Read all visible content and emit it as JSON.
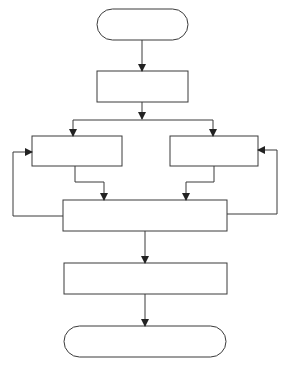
{
  "diagram": {
    "type": "flowchart",
    "colors": {
      "stroke": "#3a3a3a",
      "fill": "#ffffff",
      "background": "#ffffff"
    },
    "nodes": [
      {
        "id": "start",
        "shape": "terminator",
        "label": ""
      },
      {
        "id": "step1",
        "shape": "process",
        "label": ""
      },
      {
        "id": "branch-left",
        "shape": "process",
        "label": ""
      },
      {
        "id": "branch-right",
        "shape": "process",
        "label": ""
      },
      {
        "id": "merge",
        "shape": "process",
        "label": ""
      },
      {
        "id": "step4",
        "shape": "process",
        "label": ""
      },
      {
        "id": "end",
        "shape": "terminator",
        "label": ""
      }
    ],
    "edges": [
      {
        "from": "start",
        "to": "step1"
      },
      {
        "from": "step1",
        "to": "branch-left"
      },
      {
        "from": "step1",
        "to": "branch-right"
      },
      {
        "from": "branch-left",
        "to": "merge"
      },
      {
        "from": "branch-right",
        "to": "merge"
      },
      {
        "from": "merge",
        "to": "branch-left",
        "type": "loop-back"
      },
      {
        "from": "merge",
        "to": "branch-right",
        "type": "loop-back"
      },
      {
        "from": "merge",
        "to": "step4"
      },
      {
        "from": "step4",
        "to": "end"
      }
    ]
  }
}
